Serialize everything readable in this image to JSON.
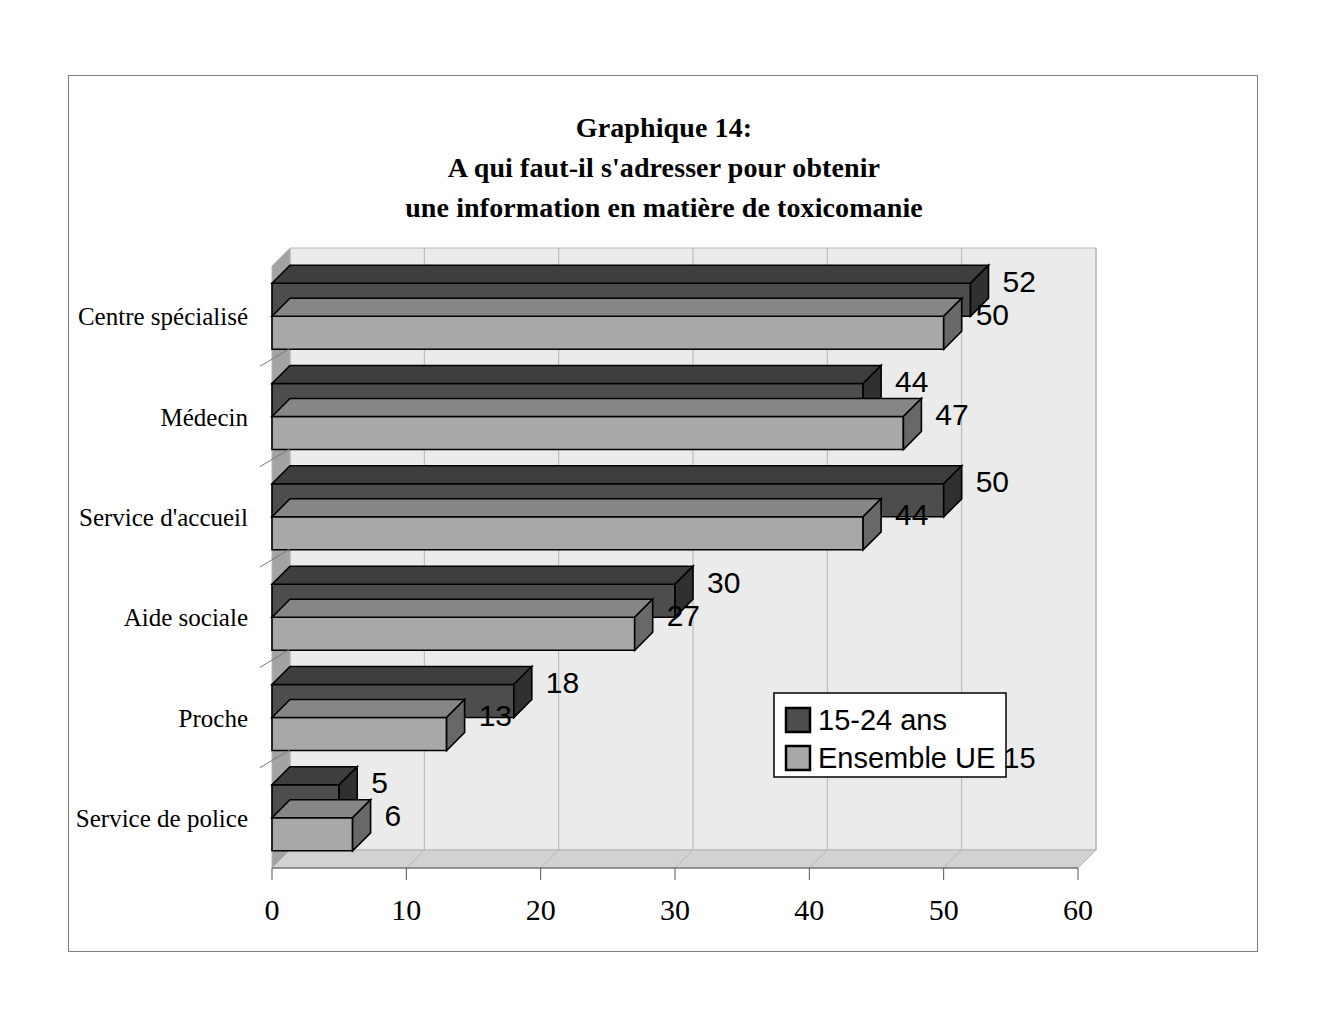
{
  "frame": {
    "border_color": "#7e7e7e"
  },
  "title": {
    "line1": "Graphique 14:",
    "line2": "A qui faut-il s'adresser pour obtenir",
    "line3": "une information en matière de toxicomanie"
  },
  "colors": {
    "series_dark": "#4d4d4d",
    "series_light": "#a8a8a8",
    "plot_background": "#ebebeb",
    "wall_side": "#a3a3a3",
    "floor": "#d2d2d2",
    "gridline": "#b4b4b4",
    "outline": "#000000",
    "legend_background": "#ffffff"
  },
  "legend": {
    "position": "inside-bottom-right",
    "items": [
      {
        "label": "15-24 ans",
        "swatch": "#4d4d4d"
      },
      {
        "label": "Ensemble UE 15",
        "swatch": "#a8a8a8"
      }
    ]
  },
  "chart_data": {
    "type": "bar",
    "orientation": "horizontal",
    "style": "3d",
    "title": "Graphique 14: A qui faut-il s'adresser pour obtenir une information en matière de toxicomanie",
    "xlabel": "",
    "ylabel": "",
    "xlim": [
      0,
      60
    ],
    "xticks": [
      0,
      10,
      20,
      30,
      40,
      50,
      60
    ],
    "xtick_labels": [
      "0",
      "10",
      "20",
      "30",
      "40",
      "50",
      "60"
    ],
    "grid": true,
    "grid_axis": "x",
    "legend_position": "lower right",
    "categories": [
      "Centre spécialisé",
      "Médecin",
      "Service d'accueil",
      "Aide sociale",
      "Proche",
      "Service de police"
    ],
    "series": [
      {
        "name": "15-24 ans",
        "color": "#4d4d4d",
        "values": [
          52,
          44,
          50,
          30,
          18,
          5
        ]
      },
      {
        "name": "Ensemble UE 15",
        "color": "#a8a8a8",
        "values": [
          50,
          47,
          44,
          27,
          13,
          6
        ]
      }
    ]
  }
}
